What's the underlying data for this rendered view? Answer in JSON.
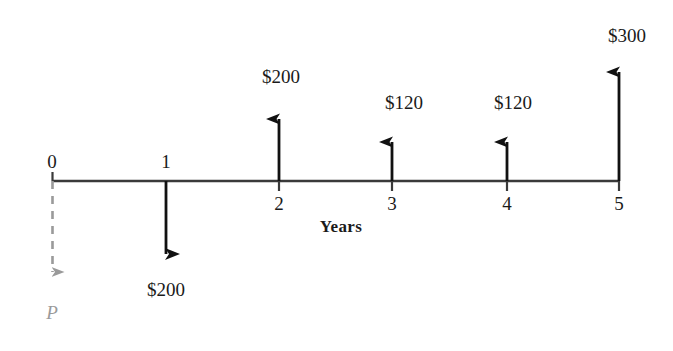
{
  "diagram": {
    "type": "cash-flow-timeline",
    "axis_title": "Years",
    "colors": {
      "line": "#3a3a3a",
      "arrow": "#111111",
      "present_value": "#9a9a9a",
      "background": "#ffffff"
    },
    "tick_labels": [
      "0",
      "1",
      "2",
      "3",
      "4",
      "5"
    ],
    "present_value_label": "P",
    "cash_flows": [
      {
        "period": "0",
        "label": "P",
        "direction": "down",
        "style": "dashed",
        "color": "#9a9a9a"
      },
      {
        "period": "1",
        "label": "$200",
        "direction": "down",
        "style": "solid",
        "color": "#111111",
        "amount": -200
      },
      {
        "period": "2",
        "label": "$200",
        "direction": "up",
        "style": "solid",
        "color": "#111111",
        "amount": 200
      },
      {
        "period": "3",
        "label": "$120",
        "direction": "up",
        "style": "solid",
        "color": "#111111",
        "amount": 120
      },
      {
        "period": "4",
        "label": "$120",
        "direction": "up",
        "style": "solid",
        "color": "#111111",
        "amount": 120
      },
      {
        "period": "5",
        "label": "$300",
        "direction": "up",
        "style": "solid",
        "color": "#111111",
        "amount": 300
      }
    ]
  }
}
